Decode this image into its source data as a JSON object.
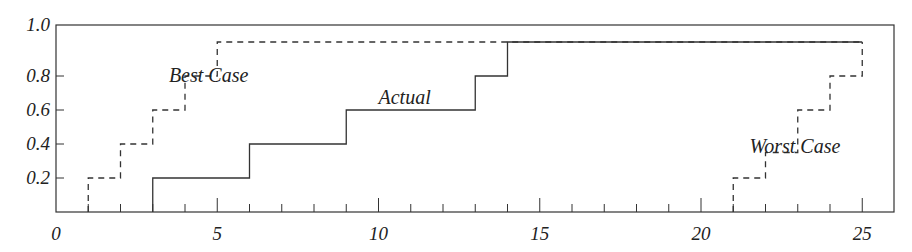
{
  "chart_data": {
    "type": "line",
    "step": true,
    "title": "",
    "xlabel": "",
    "ylabel": "",
    "xlim": [
      0,
      26
    ],
    "ylim": [
      0,
      1.1
    ],
    "x_tick_labels": [
      "0",
      "5",
      "10",
      "15",
      "20",
      "25"
    ],
    "y_tick_labels": [
      "0.2",
      "0.4",
      "0.6",
      "0.8",
      "1.0"
    ],
    "grid": false,
    "series": [
      {
        "name": "Best Case",
        "style": "dashed",
        "x": [
          1,
          2,
          3,
          4,
          5,
          25
        ],
        "y": [
          0.2,
          0.4,
          0.6,
          0.8,
          1.0,
          1.0
        ]
      },
      {
        "name": "Actual",
        "style": "solid",
        "x": [
          3,
          6,
          9,
          13,
          14,
          25
        ],
        "y": [
          0.2,
          0.4,
          0.6,
          0.8,
          1.0,
          1.0
        ]
      },
      {
        "name": "Worst Case",
        "style": "dashed",
        "x": [
          21,
          22,
          23,
          24,
          25
        ],
        "y": [
          0.2,
          0.35,
          0.6,
          0.8,
          1.0
        ]
      }
    ],
    "annotations": [
      {
        "text": "Best Case",
        "x": 3.5,
        "y": 0.8
      },
      {
        "text": "Actual",
        "x": 10,
        "y": 0.67
      },
      {
        "text": "Worst Case",
        "x": 21.5,
        "y": 0.38
      }
    ]
  }
}
